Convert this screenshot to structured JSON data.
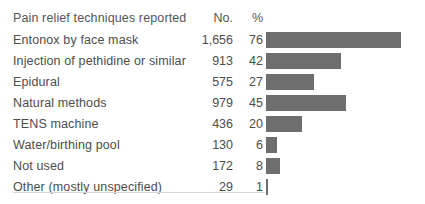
{
  "figure": {
    "name": "pain-relief-techniques-table",
    "background_color": "#ffffff",
    "text_color": "#4d4d4d",
    "bar_color": "#6e6e6e",
    "rule_color": "#d8d8d8"
  },
  "header": {
    "label": "Pain relief techniques reported",
    "no": "No.",
    "pct": "%"
  },
  "rows": [
    {
      "label": "Entonox by face mask",
      "no": "1,656",
      "pct": "76"
    },
    {
      "label": "Injection of pethidine or similar",
      "no": "913",
      "pct": "42"
    },
    {
      "label": "Epidural",
      "no": "575",
      "pct": "27"
    },
    {
      "label": "Natural methods",
      "no": "979",
      "pct": "45"
    },
    {
      "label": "TENS machine",
      "no": "436",
      "pct": "20"
    },
    {
      "label": "Water/birthing pool",
      "no": "130",
      "pct": "6"
    },
    {
      "label": "Not used",
      "no": "172",
      "pct": "8"
    },
    {
      "label": "Other (mostly unspecified)",
      "no": "29",
      "pct": "1"
    }
  ],
  "chart_data": {
    "type": "bar",
    "title": "Pain relief techniques reported",
    "orientation": "horizontal",
    "xlabel": "%",
    "ylabel": "",
    "grid": false,
    "legend": null,
    "xlim": [
      0,
      80
    ],
    "categories": [
      "Entonox by face mask",
      "Injection of pethidine or similar",
      "Epidural",
      "Natural methods",
      "TENS machine",
      "Water/birthing pool",
      "Not used",
      "Other (mostly unspecified)"
    ],
    "series": [
      {
        "name": "%",
        "values": [
          76,
          42,
          27,
          45,
          20,
          6,
          8,
          1
        ]
      },
      {
        "name": "No.",
        "values": [
          1656,
          913,
          575,
          979,
          436,
          130,
          172,
          29
        ]
      }
    ],
    "values": [
      76,
      42,
      27,
      45,
      20,
      6,
      8,
      1
    ],
    "tick_labels": [],
    "annotations": []
  }
}
